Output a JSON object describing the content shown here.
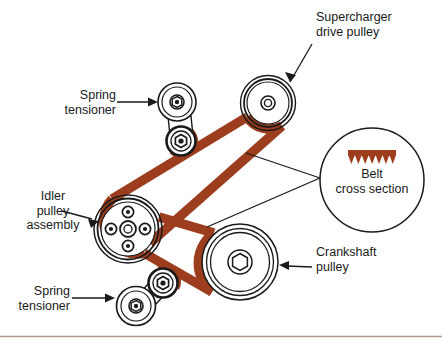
{
  "diagram": {
    "background_color": "#ffffff",
    "belt_color": "#9c3d1d",
    "outline_color": "#1a1a1a",
    "footer_rule_color": "#b09a94",
    "labels": {
      "supercharger_drive_pulley": "Supercharger\ndrive pulley",
      "spring_tensioner_upper": "Spring\ntensioner",
      "spring_tensioner_lower": "Spring\ntensioner",
      "idler_pulley_assembly": "Idler\npulley\nassembly",
      "crankshaft_pulley": "Crankshaft\npulley",
      "belt_cross_section": "Belt\ncross section"
    },
    "components": [
      {
        "name": "supercharger-drive-pulley",
        "label": "Supercharger drive pulley",
        "center": [
          268,
          103
        ],
        "outer_radius": 27,
        "rings": [
          27,
          24,
          21
        ],
        "hub_radius": 6
      },
      {
        "name": "spring-tensioner-upper",
        "label": "Spring tensioner",
        "pulley_center": [
          177,
          102
        ],
        "pulley_radius": 18,
        "pivot_center": [
          181,
          140
        ],
        "pivot_radius": 13
      },
      {
        "name": "idler-pulley-assembly",
        "label": "Idler pulley assembly",
        "center": [
          128,
          229
        ],
        "outer_radius": 33,
        "rings": [
          33,
          30,
          27
        ],
        "hub_radius": 8,
        "bolt_count": 4,
        "bolt_radius": 5,
        "bolt_orbit": 16
      },
      {
        "name": "crankshaft-pulley",
        "label": "Crankshaft pulley",
        "center": [
          240,
          262
        ],
        "outer_radius": 37,
        "rings": [
          37,
          33,
          29
        ],
        "hub_radius": 11
      },
      {
        "name": "spring-tensioner-lower",
        "label": "Spring tensioner",
        "pulley_center": [
          137,
          305
        ],
        "pulley_radius": 18,
        "pivot_center": [
          163,
          283
        ],
        "pivot_radius": 13
      },
      {
        "name": "belt-cross-section-callout",
        "label": "Belt cross section",
        "center": [
          372,
          180
        ],
        "radius": 52,
        "rib_count": 7
      }
    ],
    "belt": {
      "color": "#9c3d1d",
      "width": 9,
      "description": "Serpentine V-ribbed belt crossing itself between the idler pulley and the crankshaft pulley"
    },
    "leader_lines": [
      {
        "name": "leader-supercharger",
        "from": [
          311,
          45
        ],
        "to": [
          288,
          84
        ]
      },
      {
        "name": "leader-spring-tensioner-upper",
        "from": [
          120,
          102
        ],
        "to": [
          157,
          102
        ]
      },
      {
        "name": "leader-idler-pulley",
        "from": [
          65,
          213
        ],
        "to": [
          99,
          222
        ]
      },
      {
        "name": "leader-crankshaft",
        "from": [
          309,
          268
        ],
        "to": [
          278,
          264
        ]
      },
      {
        "name": "leader-spring-tensioner-lower",
        "from": [
          75,
          298
        ],
        "to": [
          115,
          300
        ]
      },
      {
        "name": "leader-belt-cross-section-upper",
        "from": [
          320,
          178
        ],
        "to": [
          246,
          154
        ]
      },
      {
        "name": "leader-belt-cross-section-lower",
        "from": [
          320,
          178
        ],
        "to": [
          208,
          226
        ]
      }
    ],
    "footer_rule": {
      "y": 336,
      "color": "#b09a94"
    }
  }
}
